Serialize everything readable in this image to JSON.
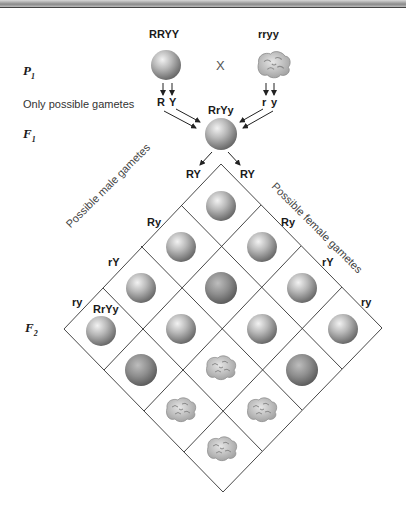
{
  "generations": {
    "p1": {
      "letter": "P",
      "sub": "1"
    },
    "f1": {
      "letter": "F",
      "sub": "1"
    },
    "f2": {
      "letter": "F",
      "sub": "2"
    }
  },
  "parents": {
    "left": {
      "genotype": "RRYY",
      "phenotype": "round-yellow",
      "gametes": [
        "R",
        "Y"
      ]
    },
    "cross": "X",
    "right": {
      "genotype": "rryy",
      "phenotype": "wrinkled-green",
      "gametes": [
        "r",
        "y"
      ]
    }
  },
  "gametes_label": "Only possible gametes",
  "f1": {
    "genotype": "RrYy"
  },
  "grid": {
    "male_axis_label": "Possible male gametes",
    "female_axis_label": "Possible female gametes",
    "male_gametes": [
      "RY",
      "Ry",
      "rY",
      "ry"
    ],
    "female_gametes": [
      "RY",
      "Ry",
      "rY",
      "ry"
    ],
    "example_cell_label": "RrYy",
    "cells": [
      [
        "round-yellow",
        "round-yellow",
        "round-yellow",
        "round-yellow"
      ],
      [
        "round-yellow",
        "round-green",
        "round-yellow",
        "round-green"
      ],
      [
        "round-yellow",
        "round-yellow",
        "wrinkled-yellow",
        "wrinkled-yellow"
      ],
      [
        "round-yellow",
        "round-green",
        "wrinkled-yellow",
        "wrinkled-green"
      ]
    ]
  },
  "colors": {
    "line": "#333333",
    "pea_light": "#dcdcdc",
    "pea_mid": "#a8a8a8",
    "pea_dark": "#6e6e6e",
    "green_mid": "#8c8c8c"
  }
}
